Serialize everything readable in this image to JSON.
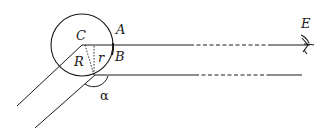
{
  "diagram": {
    "labels": {
      "center": "C",
      "top_point": "A",
      "bottom_point": "B",
      "outer_radius": "R",
      "inner_radius": "r",
      "eye": "E",
      "angle": "α"
    },
    "colors": {
      "stroke": "#1a1a1a",
      "background": "#ffffff"
    }
  }
}
